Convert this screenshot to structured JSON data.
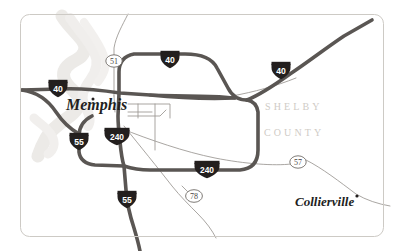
{
  "map": {
    "title": "Memphis and Shelby County, Tennessee",
    "frame": {
      "stroke_color": "#cdcac5",
      "background_color": "#ffffff"
    },
    "colors": {
      "interstate_road": "#5a5653",
      "minor_road": "#8d8984",
      "river": "#e9e7e4",
      "shield_fill": "#231f1e",
      "shield_text": "#ffffff",
      "county_label": "#cfcbc6",
      "city_label": "#231f1e"
    },
    "labels": {
      "city_memphis": "Memphis",
      "city_collierville": "Collierville",
      "county_line1": "SHELBY",
      "county_line2": "COUNTY"
    },
    "interstate_shields": [
      {
        "id": "i40-west",
        "number": "40",
        "x": 58,
        "y": 89
      },
      {
        "id": "i40-north",
        "number": "40",
        "x": 170,
        "y": 60
      },
      {
        "id": "i40-east",
        "number": "40",
        "x": 281,
        "y": 71
      },
      {
        "id": "i55-west",
        "number": "55",
        "x": 79,
        "y": 142
      },
      {
        "id": "i55-south",
        "number": "55",
        "x": 127,
        "y": 200
      },
      {
        "id": "i240-north",
        "number": "240",
        "x": 117,
        "y": 137
      },
      {
        "id": "i240-south",
        "number": "240",
        "x": 207,
        "y": 170
      }
    ],
    "route_ovals": [
      {
        "id": "us51",
        "number": "51",
        "x": 114,
        "y": 61
      },
      {
        "id": "us78",
        "number": "78",
        "x": 194,
        "y": 196
      },
      {
        "id": "sr57",
        "number": "57",
        "x": 298,
        "y": 162
      }
    ],
    "city_dots": [
      {
        "id": "memphis-dot",
        "x": 93,
        "y": 99
      },
      {
        "id": "collierville-dot",
        "x": 356,
        "y": 197
      }
    ]
  }
}
